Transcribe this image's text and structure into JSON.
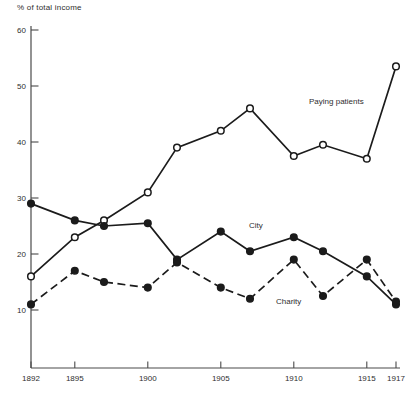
{
  "figure": {
    "ylabel": "% of total income"
  },
  "chart_data": {
    "type": "line",
    "title": "",
    "xlabel": "",
    "ylabel": "% of total income",
    "x": [
      1892,
      1895,
      1897,
      1900,
      1902,
      1905,
      1907,
      1910,
      1912,
      1915,
      1917
    ],
    "x_tick_labels": [
      "1892",
      "1895",
      "1900",
      "1905",
      "1910",
      "1915",
      "1917"
    ],
    "y_ticks": [
      10,
      20,
      30,
      40,
      50,
      60
    ],
    "ylim": [
      10,
      60
    ],
    "xlim": [
      1892,
      1917
    ],
    "grid": false,
    "legend": "inline-annotations",
    "series": [
      {
        "name": "Paying patients",
        "marker": "open-circle",
        "line": "solid",
        "values": [
          16,
          23,
          26,
          31,
          39,
          42,
          46,
          37.5,
          39.5,
          37,
          53.5
        ],
        "label_pos": {
          "x": 309,
          "y": 104
        }
      },
      {
        "name": "City",
        "marker": "filled-circle",
        "line": "solid",
        "values": [
          29,
          26,
          25,
          25.5,
          19,
          24,
          20.5,
          23,
          20.5,
          16,
          11
        ],
        "label_pos": {
          "x": 249,
          "y": 228
        }
      },
      {
        "name": "Charity",
        "marker": "filled-circle",
        "line": "dashed",
        "values": [
          11,
          17,
          15,
          14,
          18.5,
          14,
          12,
          19,
          12.5,
          19,
          11.5
        ],
        "label_pos": {
          "x": 276,
          "y": 304
        }
      }
    ],
    "colors": {
      "line": "#1b1b1b",
      "axis": "#4a4a4a",
      "text": "#2e2e2e",
      "background": "#ffffff"
    }
  }
}
